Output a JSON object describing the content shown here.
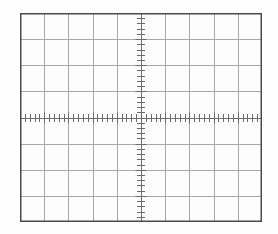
{
  "instrument": {
    "display_type": "oscilloscope-graticule",
    "description": "CRT graticule grid with center axes and minor tick marks"
  },
  "graticule": {
    "border_label": "graticule-border",
    "background_color": "#fdfdfd",
    "border_color": "#4a4a4a",
    "gridline_color": "#a8a8a8",
    "axis_color": "#707070",
    "tick_color": "#6a6a6a",
    "horizontal_divisions": 10,
    "vertical_divisions": 8,
    "minor_ticks_per_division": 5,
    "center_x_division": 5,
    "center_y_division": 4,
    "geometry": {
      "left": 20,
      "top": 13,
      "width": 242,
      "height": 209
    }
  },
  "chart_data": {
    "type": "line",
    "title": "",
    "subtitle": "",
    "xlabel": "",
    "ylabel": "",
    "xlim": [
      -5,
      5
    ],
    "ylim": [
      -4,
      4
    ],
    "xticks": [
      -5,
      -4,
      -3,
      -2,
      -1,
      0,
      1,
      2,
      3,
      4,
      5
    ],
    "yticks": [
      -4,
      -3,
      -2,
      -1,
      0,
      1,
      2,
      3,
      4
    ],
    "xtick_labels": [
      "",
      "",
      "",
      "",
      "",
      "",
      "",
      "",
      "",
      "",
      ""
    ],
    "ytick_labels": [
      "",
      "",
      "",
      "",
      "",
      "",
      "",
      "",
      ""
    ],
    "minor_ticks_per_major_x": 5,
    "minor_ticks_per_major_y": 5,
    "grid": true,
    "legend": null,
    "series": [],
    "annotations": []
  }
}
